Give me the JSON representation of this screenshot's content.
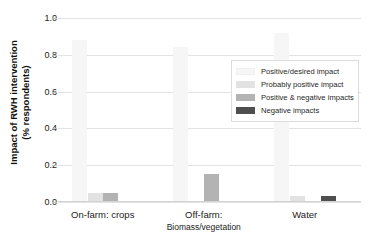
{
  "chart_data": {
    "type": "bar",
    "title": "",
    "xlabel": "",
    "ylabel": "Impact of RWH intervention (% respondents)",
    "ylabel_line1": "Impact of RWH intervention",
    "ylabel_line2": "(% respondents)",
    "categories": [
      "On-farm: crops",
      "Off-farm: Biomass/vegetation",
      "Water"
    ],
    "category_labels": [
      {
        "line1": "On-farm: crops",
        "line2": ""
      },
      {
        "line1": "Off-farm:",
        "line2": "Biomass/vegetation"
      },
      {
        "line1": "Water",
        "line2": ""
      }
    ],
    "series": [
      {
        "name": "Positive/desired impact",
        "color": "#f6f6f6",
        "values": [
          0.88,
          0.84,
          0.92
        ]
      },
      {
        "name": "Probably positive impact",
        "color": "#e2e2e2",
        "values": [
          0.05,
          0.0,
          0.03
        ]
      },
      {
        "name": "Positive & negative impacts",
        "color": "#b3b3b3",
        "values": [
          0.05,
          0.15,
          0.0
        ]
      },
      {
        "name": "Negative impacts",
        "color": "#4f4f4f",
        "values": [
          0.0,
          0.0,
          0.03
        ]
      }
    ],
    "ylim": [
      0.0,
      1.0
    ],
    "yticks": [
      0.0,
      0.2,
      0.4,
      0.6,
      0.8,
      1.0
    ],
    "ytick_labels": [
      "0.0",
      "0.2",
      "0.4",
      "0.6",
      "0.8",
      "1.0"
    ],
    "grid": true,
    "grid_axis": "y",
    "legend_position": "upper right",
    "background": "#ffffff"
  }
}
